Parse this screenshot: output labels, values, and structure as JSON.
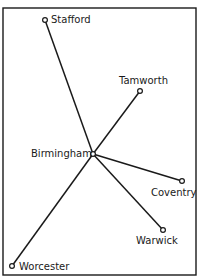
{
  "diagram": {
    "type": "route-map",
    "hub": "Birmingham",
    "towns": [
      {
        "name": "Stafford",
        "x": 45,
        "y": 20,
        "label_x": 51,
        "label_y": 23,
        "anchor": "start"
      },
      {
        "name": "Tamworth",
        "x": 140,
        "y": 91,
        "label_x": 119,
        "label_y": 84,
        "anchor": "start"
      },
      {
        "name": "Birmingham",
        "x": 93,
        "y": 154,
        "label_x": 31,
        "label_y": 157,
        "anchor": "start"
      },
      {
        "name": "Coventry",
        "x": 182,
        "y": 181,
        "label_x": 151,
        "label_y": 196,
        "anchor": "start"
      },
      {
        "name": "Warwick",
        "x": 163,
        "y": 230,
        "label_x": 136,
        "label_y": 244,
        "anchor": "start"
      },
      {
        "name": "Worcester",
        "x": 12,
        "y": 266,
        "label_x": 19,
        "label_y": 270,
        "anchor": "start"
      }
    ],
    "routes": [
      {
        "from": "Birmingham",
        "to": "Stafford"
      },
      {
        "from": "Birmingham",
        "to": "Tamworth"
      },
      {
        "from": "Birmingham",
        "to": "Coventry"
      },
      {
        "from": "Birmingham",
        "to": "Warwick"
      },
      {
        "from": "Birmingham",
        "to": "Worcester"
      }
    ],
    "frame": {
      "x": 3,
      "y": 8,
      "width": 193,
      "height": 267
    },
    "colors": {
      "ink": "#1a1a1a",
      "background": "#ffffff"
    }
  }
}
